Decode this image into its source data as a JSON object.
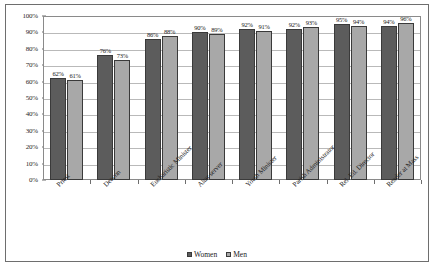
{
  "chart_data": {
    "type": "bar",
    "title": "",
    "subtitle": "",
    "xlabel": "",
    "ylabel": "",
    "ylim": [
      0,
      100
    ],
    "grid": true,
    "legend_position": "bottom",
    "categories": [
      "Priest",
      "Deacon",
      "Eucharistic Minister",
      "Altar server",
      "Youth Minister",
      "Parish Administrator",
      "Rel. Ed. Director",
      "Reader at Mass"
    ],
    "y_ticks": [
      "0%",
      "10%",
      "20%",
      "30%",
      "40%",
      "50%",
      "60%",
      "70%",
      "80%",
      "90%",
      "100%"
    ],
    "y_tick_values": [
      0,
      10,
      20,
      30,
      40,
      50,
      60,
      70,
      80,
      90,
      100
    ],
    "series": [
      {
        "name": "Women",
        "color": "#5c5c5c",
        "values": [
          62,
          76,
          86,
          90,
          92,
          92,
          95,
          94
        ],
        "labels": [
          "62%",
          "76%",
          "86%",
          "90%",
          "92%",
          "92%",
          "95%",
          "94%"
        ]
      },
      {
        "name": "Men",
        "color": "#a8a8a8",
        "values": [
          61,
          73,
          88,
          89,
          91,
          93,
          94,
          96
        ],
        "labels": [
          "61%",
          "73%",
          "88%",
          "89%",
          "91%",
          "93%",
          "94%",
          "96%"
        ]
      }
    ]
  }
}
